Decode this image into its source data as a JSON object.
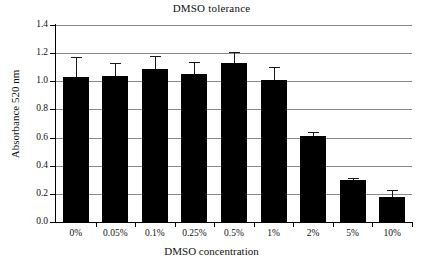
{
  "chart_data": {
    "type": "bar",
    "title": "DMSO tolerance",
    "xlabel": "DMSO concentration",
    "ylabel": "Absorbance 520 nm",
    "categories": [
      "0%",
      "0.05%",
      "0.1%",
      "0.25%",
      "0.5%",
      "1%",
      "2%",
      "5%",
      "10%"
    ],
    "values": [
      1.03,
      1.04,
      1.09,
      1.05,
      1.13,
      1.01,
      0.61,
      0.3,
      0.18
    ],
    "errors": [
      0.14,
      0.09,
      0.09,
      0.09,
      0.08,
      0.09,
      0.03,
      0.01,
      0.05
    ],
    "ylim": [
      0.0,
      1.4
    ],
    "ytick_labels": [
      "0.0",
      "0.2",
      "0.4",
      "0.6",
      "0.8",
      "1.0",
      "1.2",
      "1.4"
    ],
    "ytick_values": [
      0.0,
      0.2,
      0.4,
      0.6,
      0.8,
      1.0,
      1.2,
      1.4
    ],
    "grid": true,
    "legend": null,
    "bar_color": "#000000",
    "grid_color": "#8a8a8a"
  }
}
